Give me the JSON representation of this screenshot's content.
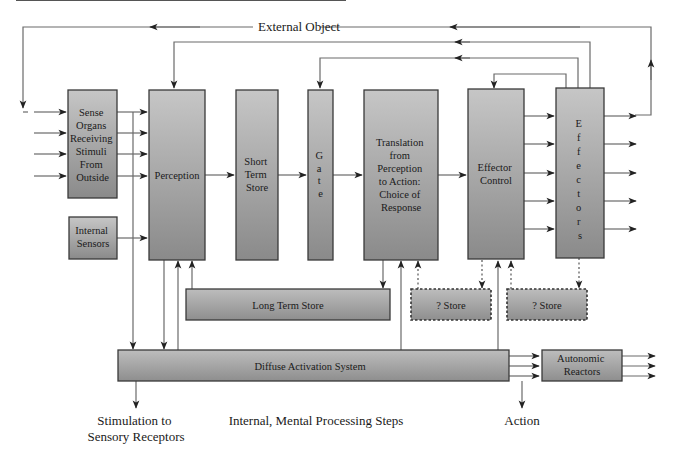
{
  "diagram": {
    "title_label": "External Object",
    "blocks": {
      "sense_organs": {
        "lines": [
          "Sense",
          "Organs",
          "Receiving",
          "Stimuli",
          "From",
          "Outside"
        ]
      },
      "internal_sensors": {
        "lines": [
          "Internal",
          "Sensors"
        ]
      },
      "perception": {
        "lines": [
          "Perception"
        ]
      },
      "short_term_store": {
        "lines": [
          "Short",
          "Term",
          "Store"
        ]
      },
      "gate": {
        "lines": [
          "G",
          "a",
          "t",
          "e"
        ]
      },
      "translation": {
        "lines": [
          "Translation",
          "from",
          "Perception",
          "to Action:",
          "Choice of",
          "Response"
        ]
      },
      "effector_control": {
        "lines": [
          "Effector",
          "Control"
        ]
      },
      "effectors": {
        "lines": [
          "E",
          "f",
          "f",
          "e",
          "c",
          "t",
          "o",
          "r",
          "s"
        ]
      },
      "long_term_store": {
        "lines": [
          "Long Term Store"
        ]
      },
      "unknown_store_1": {
        "lines": [
          "? Store"
        ]
      },
      "unknown_store_2": {
        "lines": [
          "? Store"
        ]
      },
      "diffuse_activation": {
        "lines": [
          "Diffuse Activation System"
        ]
      },
      "autonomic_reactors": {
        "lines": [
          "Autonomic",
          "Reactors"
        ]
      }
    },
    "captions": {
      "stimulation": [
        "Stimulation to",
        "Sensory Receptors"
      ],
      "internal_steps": "Internal, Mental Processing Steps",
      "action": "Action"
    },
    "colors": {
      "box_top": "#c4c4c4",
      "box_bottom": "#8c8c8c",
      "line": "#6a6a6a",
      "text": "#1a1a1a"
    }
  }
}
